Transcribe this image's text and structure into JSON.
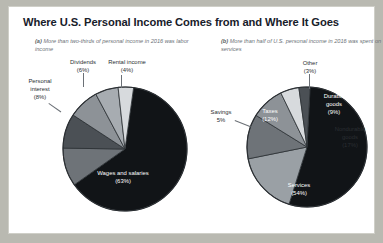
{
  "figure": {
    "title": "Where U.S. Personal Income Comes from and Where It Goes",
    "panel_a_caption_tag": "(a)",
    "panel_a_caption": " More than two-thirds of personal income in 2016 was labor income",
    "panel_b_caption_tag": "(b)",
    "panel_b_caption": " More than half of U.S. personal income in 2016 was spent on services"
  },
  "chart_data": [
    {
      "type": "pie",
      "title": "(a) More than two-thirds of personal income in 2016 was labor income",
      "categories": [
        "Wages and salaries",
        "Transfer payments",
        "Proprietors' income",
        "Personal interest",
        "Dividends",
        "Rental income"
      ],
      "values": [
        63,
        10,
        9,
        8,
        6,
        4
      ],
      "labels": [
        {
          "name": "Wages and salaries",
          "pct": "63%",
          "text": "Wages and salaries",
          "pct_text": "(63%)"
        },
        {
          "name": "Transfer payments",
          "pct": "10%",
          "text": "Transfer payments",
          "pct_text": "(10%)"
        },
        {
          "name": "Proprietors' income",
          "pct": "9%",
          "text": "Proprietors' income",
          "pct_text": "(9%)"
        },
        {
          "name": "Personal interest",
          "pct": "8%",
          "text": "Personal interest",
          "pct_text": "(8%)"
        },
        {
          "name": "Dividends",
          "pct": "6%",
          "text": "Dividends",
          "pct_text": "(6%)"
        },
        {
          "name": "Rental income",
          "pct": "4%",
          "text": "Rental income",
          "pct_text": "(4%)"
        }
      ],
      "legend": "none",
      "colors": [
        "#111417",
        "#6e7378",
        "#4b5055",
        "#8d9297",
        "#a7acb1",
        "#d7dadd"
      ]
    },
    {
      "type": "pie",
      "title": "(b) More than half of U.S. personal income in 2016 was spent on services",
      "categories": [
        "Services",
        "Nondurable goods",
        "Taxes",
        "Durable goods",
        "Savings",
        "Other"
      ],
      "values": [
        54,
        17,
        12,
        9,
        5,
        3
      ],
      "labels": [
        {
          "name": "Services",
          "pct": "54%",
          "text": "Services",
          "pct_text": "(54%)"
        },
        {
          "name": "Nondurable goods",
          "pct": "17%",
          "text": "Nondurable goods",
          "pct_text": "(17%)"
        },
        {
          "name": "Taxes",
          "pct": "12%",
          "text": "Taxes",
          "pct_text": "(12%)"
        },
        {
          "name": "Durable goods",
          "pct": "9%",
          "text": "Durable goods",
          "pct_text": "(9%)"
        },
        {
          "name": "Savings",
          "pct": "5%",
          "text": "Savings",
          "pct_text": "5%"
        },
        {
          "name": "Other",
          "pct": "3%",
          "text": "Other",
          "pct_text": "(3%)"
        }
      ],
      "legend": "none",
      "colors": [
        "#111417",
        "#9aa0a5",
        "#6e7378",
        "#8d9297",
        "#d7dadd",
        "#4b5055"
      ]
    }
  ],
  "labels_a": {
    "dividends": "Dividends",
    "dividends_pct": "(6%)",
    "rental": "Rental income",
    "rental_pct": "(4%)",
    "interest_1": "Personal",
    "interest_2": "interest",
    "interest_pct": "(8%)",
    "transfer_1": "Transfer",
    "transfer_2": "payments",
    "transfer_pct": "(10%)",
    "proprietors_1": "Proprietors'",
    "proprietors_2": "income",
    "proprietors_pct": "(9%)",
    "wages": "Wages and salaries",
    "wages_pct": "(63%)"
  },
  "labels_b": {
    "other": "Other",
    "other_pct": "(3%)",
    "durable_1": "Durable",
    "durable_2": "goods",
    "durable_pct": "(9%)",
    "nondurable_1": "Nondurable",
    "nondurable_2": "goods",
    "nondurable_pct": "(17%)",
    "taxes": "Taxes",
    "taxes_pct": "(12%)",
    "savings": "Savings",
    "savings_pct": "5%",
    "services": "Services",
    "services_pct": "(54%)"
  }
}
